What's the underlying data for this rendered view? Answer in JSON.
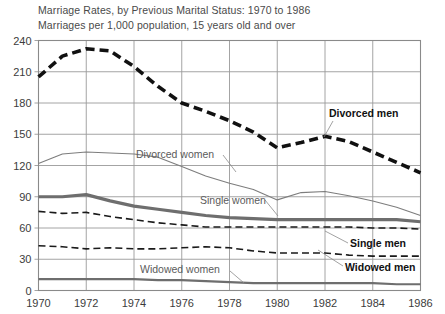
{
  "title": {
    "main": "Marriage Rates, by Previous Marital Status: 1970 to 1986",
    "subtitle": "Marriages per 1,000 population, 15 years old and over"
  },
  "axis": {
    "y_ticks": [
      "0",
      "30",
      "60",
      "90",
      "120",
      "150",
      "180",
      "210",
      "240"
    ],
    "x_ticks": [
      "1970",
      "1972",
      "1974",
      "1976",
      "1978",
      "1980",
      "1982",
      "1984",
      "1986"
    ]
  },
  "series_labels": {
    "divorced_men": "Divorced men",
    "divorced_women": "Divorced women",
    "single_women": "Single women",
    "single_men": "Single men",
    "widowed_men": "Widowed men",
    "widowed_women": "Widowed women"
  },
  "colors": {
    "divorced_men": "#111111",
    "divorced_women": "#7d7d7d",
    "single_women": "#6e6e6e",
    "single_men": "#1a1a1a",
    "widowed_men": "#1a1a1a",
    "widowed_women": "#6e6e6e",
    "grid": "#9a9a9a",
    "frame": "#8a8a8a",
    "background": "#ffffff",
    "text": "#4a4a4a"
  },
  "chart_data": {
    "type": "line",
    "title": "Marriage Rates, by Previous Marital Status: 1970 to 1986",
    "subtitle": "Marriages per 1,000 population, 15 years old and over",
    "xlabel": "",
    "ylabel": "Marriages per 1,000 population, 15 years old and over",
    "xlim": [
      1970,
      1986
    ],
    "ylim": [
      0,
      240
    ],
    "grid": true,
    "legend": "inline-annotations",
    "x": [
      1970,
      1971,
      1972,
      1973,
      1974,
      1975,
      1976,
      1977,
      1978,
      1979,
      1980,
      1981,
      1982,
      1983,
      1984,
      1985,
      1986
    ],
    "series": [
      {
        "name": "Divorced men",
        "style": "thick-dashed-black",
        "values": [
          205,
          225,
          232,
          230,
          215,
          196,
          180,
          172,
          163,
          152,
          137,
          142,
          148,
          143,
          133,
          123,
          113
        ]
      },
      {
        "name": "Divorced women",
        "style": "thin-solid-gray",
        "values": [
          122,
          131,
          133,
          132,
          131,
          128,
          119,
          110,
          103,
          97,
          87,
          94,
          95,
          91,
          86,
          80,
          72
        ]
      },
      {
        "name": "Single women",
        "style": "thick-solid-gray",
        "values": [
          90,
          90,
          92,
          86,
          81,
          78,
          75,
          72,
          70,
          69,
          68,
          68,
          68,
          68,
          68,
          68,
          66
        ]
      },
      {
        "name": "Single men",
        "style": "medium-dashed-black",
        "values": [
          76,
          74,
          75,
          71,
          68,
          65,
          63,
          61,
          61,
          61,
          61,
          61,
          61,
          61,
          60,
          60,
          59
        ]
      },
      {
        "name": "Widowed men",
        "style": "medium-dashed-black",
        "values": [
          43,
          42,
          40,
          41,
          40,
          40,
          41,
          42,
          41,
          38,
          36,
          36,
          36,
          34,
          33,
          33,
          33
        ]
      },
      {
        "name": "Widowed women",
        "style": "thick-solid-gray",
        "values": [
          11,
          11,
          11,
          11,
          11,
          10,
          10,
          9,
          8,
          7,
          7,
          7,
          7,
          7,
          7,
          6,
          6
        ]
      }
    ]
  }
}
